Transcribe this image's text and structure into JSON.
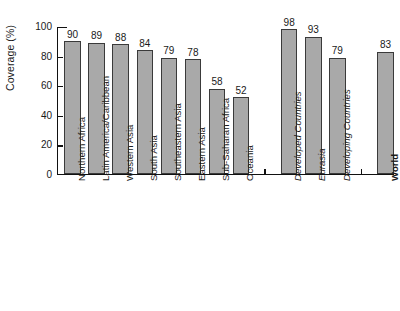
{
  "chart_data": {
    "type": "bar",
    "title": "",
    "xlabel": "",
    "ylabel": "Coverage (%)",
    "ylim": [
      0,
      100
    ],
    "yticks": [
      0,
      20,
      40,
      60,
      80,
      100
    ],
    "grid": false,
    "legend": "none",
    "orientation": "vertical",
    "bar_color": "#a9a9a9",
    "bar_edge_color": "#3a3a3a",
    "categories": [
      "Northern Africa",
      "Latin America/Caribbean",
      "Western Asia",
      "South Asia",
      "Southeastern Asia",
      "Eastern Asia",
      "Sub-Saharan Africa",
      "Oceania",
      "Developed Countries",
      "Eurasia",
      "Developing Countries",
      "World"
    ],
    "values": [
      90,
      89,
      88,
      84,
      79,
      78,
      58,
      52,
      98,
      93,
      79,
      83
    ],
    "label_styles": [
      "normal",
      "normal",
      "normal",
      "normal",
      "normal",
      "normal",
      "normal",
      "normal",
      "italic",
      "italic",
      "italic",
      "bold"
    ],
    "groups": [
      {
        "name": "regions",
        "indices": [
          0,
          1,
          2,
          3,
          4,
          5,
          6,
          7
        ]
      },
      {
        "name": "development-groups",
        "indices": [
          8,
          9,
          10
        ]
      },
      {
        "name": "world",
        "indices": [
          11
        ]
      }
    ],
    "group_separator_ticks": 2
  }
}
